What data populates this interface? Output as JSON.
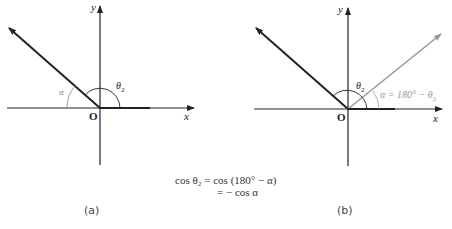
{
  "diagram": {
    "panel_a": {
      "caption": "(a)",
      "origin_label": "O",
      "x_label": "x",
      "y_label": "y",
      "angle_theta_label": "θ",
      "angle_theta_sub": "2",
      "angle_alpha_label": "α"
    },
    "panel_b": {
      "caption": "(b)",
      "origin_label": "O",
      "x_label": "x",
      "y_label": "y",
      "angle_theta_label": "θ",
      "angle_theta_sub": "2",
      "alpha_expr": "α = 180° − θ",
      "alpha_expr_sub": "2"
    },
    "equation": {
      "line1": "cos θ₂ = cos (180° − α)",
      "line2": "= − cos α"
    },
    "colors": {
      "main_vector": "#222222",
      "reflected_vector": "#999999",
      "axis": "#222222"
    }
  }
}
